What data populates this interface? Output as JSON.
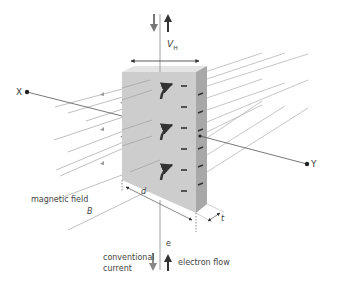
{
  "diagram": {
    "labels": {
      "hall_voltage_main": "V",
      "hall_voltage_sub": "H",
      "axis_x": "X",
      "axis_y": "Y",
      "magnetic_field": "magnetic field",
      "field_symbol": "B",
      "width_symbol": "d",
      "thickness_symbol": "t",
      "electron_symbol": "e",
      "conventional_current_line1": "conventional",
      "conventional_current_line2": "current",
      "electron_flow": "electron flow"
    },
    "colors": {
      "block_front": "#cfcfcf",
      "block_side": "#a9a9a9",
      "block_top": "#e2e2e2",
      "field_lines": "#b0b0b0",
      "arrows": "#333333",
      "charges": "#333333"
    },
    "charge_marks_front": 6,
    "charge_marks_side": 6,
    "curved_arrows": 3
  }
}
